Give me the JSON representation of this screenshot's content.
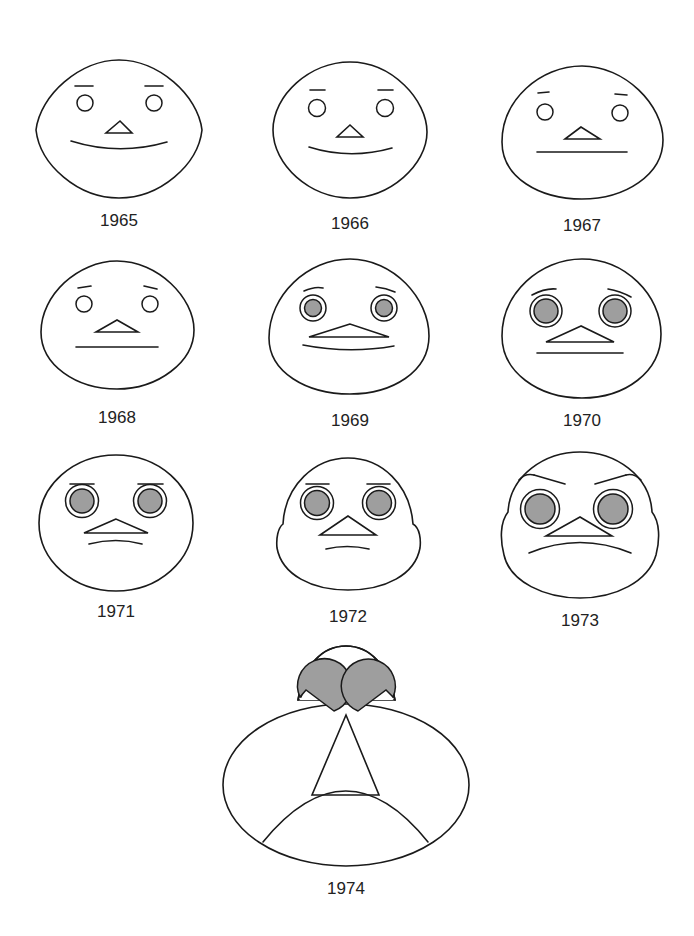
{
  "diagram": {
    "type": "chernoff-faces",
    "fill_color": "#9e9e9e",
    "stroke_color": "#1a1a1a",
    "faces": [
      {
        "year": "1965",
        "eyes": "open-small",
        "pupil_filled": false,
        "mouth": "smile"
      },
      {
        "year": "1966",
        "eyes": "open-small",
        "pupil_filled": false,
        "mouth": "smile"
      },
      {
        "year": "1967",
        "eyes": "open-small",
        "pupil_filled": false,
        "mouth": "flat"
      },
      {
        "year": "1968",
        "eyes": "open-small",
        "pupil_filled": false,
        "mouth": "flat"
      },
      {
        "year": "1969",
        "eyes": "ringed",
        "pupil_filled": true,
        "mouth": "slight-smile"
      },
      {
        "year": "1970",
        "eyes": "ringed",
        "pupil_filled": true,
        "mouth": "flat"
      },
      {
        "year": "1971",
        "eyes": "ringed",
        "pupil_filled": true,
        "mouth": "slight-frown"
      },
      {
        "year": "1972",
        "eyes": "ringed",
        "pupil_filled": true,
        "mouth": "slight-frown"
      },
      {
        "year": "1973",
        "eyes": "ringed-large",
        "pupil_filled": true,
        "mouth": "frown"
      },
      {
        "year": "1974",
        "eyes": "large-filled",
        "pupil_filled": true,
        "mouth": "deep-frown"
      }
    ]
  }
}
